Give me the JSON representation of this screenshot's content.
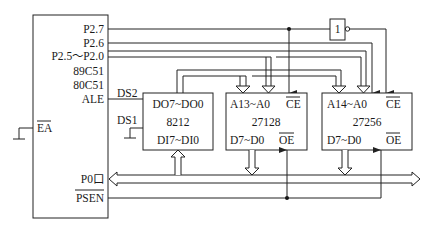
{
  "diagram": {
    "mcu": {
      "name_lines": [
        "89C51",
        "80C51"
      ],
      "pins": {
        "p27": "P2.7",
        "p26": "P2.6",
        "p25_20": "P2.5～P2.0",
        "ale": "ALE",
        "ea": "EA",
        "p0": "P0口",
        "psen": "PSEN"
      }
    },
    "latch": {
      "name": "8212",
      "out_label": "DO7~DO0",
      "in_label": "DI7~DI0",
      "ds2": "DS2",
      "ds1": "DS1"
    },
    "eprom1": {
      "name": "27128",
      "addr_label": "A13~A0",
      "ce_label": "CE",
      "data_label": "D7~D0",
      "oe_label": "OE"
    },
    "eprom2": {
      "name": "27256",
      "addr_label": "A14~A0",
      "ce_label": "CE",
      "data_label": "D7~D0",
      "oe_label": "OE"
    },
    "inverter": {
      "symbol": "1"
    }
  }
}
